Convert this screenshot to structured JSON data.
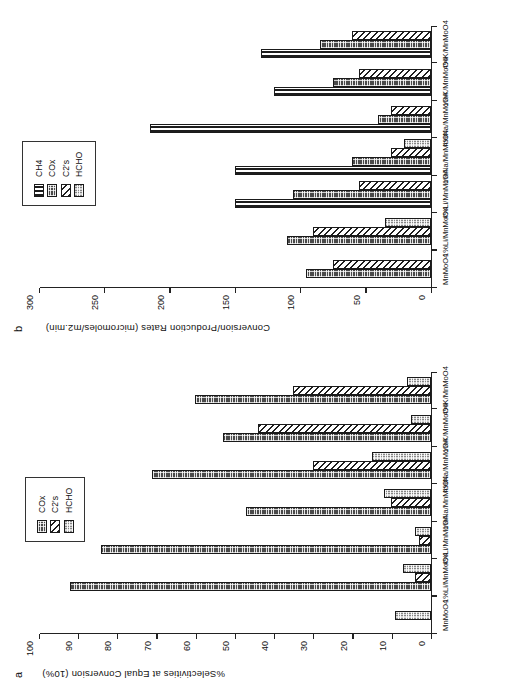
{
  "figure": {
    "background": "#ffffff",
    "orientation_note": "page rotated 90 degrees"
  },
  "panels": [
    {
      "letter": "a",
      "axis_title": "%Selectivities at Equal Conversion (10%)"
    },
    {
      "letter": "b",
      "axis_title": "Conversion/Production  Rates  (micromoles/m2.min)"
    }
  ],
  "legend_a": {
    "items": [
      {
        "label": "COx",
        "pattern": "p-cox"
      },
      {
        "label": "C2's",
        "pattern": "p-c2"
      },
      {
        "label": "HCHO",
        "pattern": "p-hcho"
      }
    ]
  },
  "legend_b": {
    "items": [
      {
        "label": "CH4",
        "pattern": "p-ch4"
      },
      {
        "label": "COx",
        "pattern": "p-cox"
      },
      {
        "label": "C2's",
        "pattern": "p-c2"
      },
      {
        "label": "HCHO",
        "pattern": "p-hcho"
      }
    ]
  },
  "chart_data": [
    {
      "type": "bar",
      "panel": "a",
      "title": "%Selectivities at Equal Conversion (10%)",
      "xlabel": "",
      "ylabel": "%Selectivities at Equal Conversion (10%)",
      "ylim": [
        0,
        100
      ],
      "yticks": [
        0,
        10,
        20,
        30,
        40,
        50,
        60,
        70,
        80,
        90,
        100
      ],
      "grid": false,
      "legend_position": "top-right",
      "categories": [
        "MnMoO4",
        "1%Li/MnMoO4",
        "4%Li/MnMoO4",
        "1%Na/MnMoO4",
        "4%Na/MnMoO4",
        "1%K/MnMoO4",
        "4%K/MnMoO4"
      ],
      "series": [
        {
          "name": "COx",
          "values": [
            92,
            84,
            47,
            71,
            53,
            60
          ]
        },
        {
          "name": "C2's",
          "values": [
            4,
            3,
            10,
            30,
            44,
            35
          ]
        },
        {
          "name": "HCHO",
          "values": [
            9,
            7,
            4,
            12,
            15,
            5,
            6
          ]
        }
      ],
      "series_note": "MnMoO4 bar group shows HCHO only; remaining six groups show COx, C2's, HCHO"
    },
    {
      "type": "bar",
      "panel": "b",
      "title": "Conversion/Production  Rates  (micromoles/m2.min)",
      "xlabel": "",
      "ylabel": "Conversion/Production  Rates  (micromoles/m2.min)",
      "ylim": [
        0,
        300
      ],
      "yticks": [
        0,
        50,
        100,
        150,
        200,
        250,
        300
      ],
      "grid": false,
      "legend_position": "top-right",
      "categories": [
        "MnMoO4",
        "1%Li/MnMoO4",
        "4%Li/MnMoO4",
        "1%Na/MnMoO4",
        "4%Na/MnMoO4",
        "1%K/MnMoO4",
        "4%K/MnMoO4"
      ],
      "series": [
        {
          "name": "CH4",
          "values": [
            0,
            0,
            150,
            150,
            215,
            120,
            130
          ]
        },
        {
          "name": "COx",
          "values": [
            95,
            110,
            105,
            60,
            40,
            75,
            85
          ]
        },
        {
          "name": "C2's",
          "values": [
            75,
            90,
            55,
            30,
            30,
            55,
            60
          ]
        },
        {
          "name": "HCHO",
          "values": [
            0,
            35,
            0,
            20,
            0,
            0,
            0
          ]
        }
      ]
    }
  ]
}
